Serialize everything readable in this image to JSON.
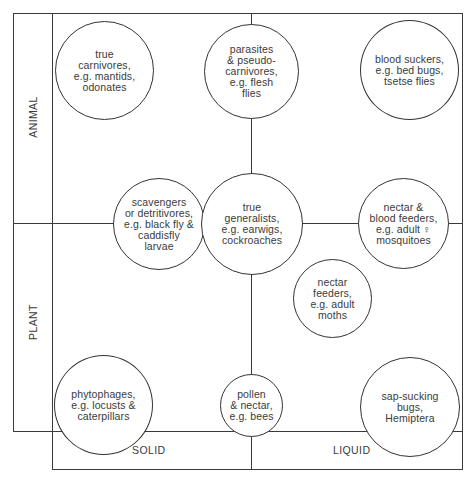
{
  "diagram": {
    "axes": {
      "y_axis_labels": [
        "ANIMAL",
        "PLANT"
      ],
      "x_axis_labels": [
        "SOLID",
        "LIQUID"
      ]
    },
    "nodes": [
      {
        "id": "true-carnivores",
        "text": "true\ncarnivores,\ne.g. mantids,\nodonates",
        "quadrant": "animal-solid"
      },
      {
        "id": "parasites",
        "text": "parasites\n& pseudo-\ncarnivores,\ne.g. flesh\nflies",
        "quadrant": "animal-boundary"
      },
      {
        "id": "blood-suckers",
        "text": "blood suckers,\ne.g. bed bugs,\ntsetse flies",
        "quadrant": "animal-liquid"
      },
      {
        "id": "scavengers",
        "text": "scavengers\nor detritivores,\ne.g. black fly &\ncaddisfly\nlarvae",
        "quadrant": "solid-boundary"
      },
      {
        "id": "true-generalists",
        "text": "true\ngeneralists,\ne.g. earwigs,\ncockroaches",
        "quadrant": "center"
      },
      {
        "id": "nectar-blood-feeders",
        "text": "nectar &\nblood feeders,\ne.g. adult ♀\nmosquitoes",
        "quadrant": "liquid-boundary"
      },
      {
        "id": "nectar-feeders",
        "text": "nectar\nfeeders,\ne.g. adult\nmoths",
        "quadrant": "plant-liquid"
      },
      {
        "id": "phytophages",
        "text": "phytophages,\ne.g. locusts &\ncaterpillars",
        "quadrant": "plant-solid"
      },
      {
        "id": "pollen-nectar",
        "text": "pollen\n& nectar,\ne.g. bees",
        "quadrant": "plant-boundary"
      },
      {
        "id": "sap-sucking",
        "text": "sap-sucking\nbugs,\nHemiptera",
        "quadrant": "plant-liquid"
      }
    ]
  }
}
